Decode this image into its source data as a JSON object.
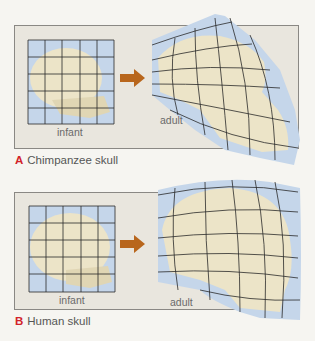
{
  "panels": [
    {
      "letter": "A",
      "caption": "Chimpanzee skull",
      "infant_label": "infant",
      "adult_label": "adult"
    },
    {
      "letter": "B",
      "caption": "Human skull",
      "infant_label": "infant",
      "adult_label": "adult"
    }
  ],
  "colors": {
    "grid_fill": "#c5d6ea",
    "grid_line": "#2a2a2a",
    "bone": "#ece4c8",
    "arrow": "#b8661c",
    "frame_bg": "#e9e6de",
    "accent": "#d2232a"
  }
}
